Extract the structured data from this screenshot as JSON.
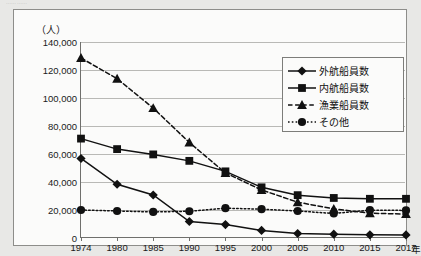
{
  "page": {
    "top_fragment": "⋯⋯  ⋯⋯",
    "unit_label": "（人）",
    "xaxis_unit": "年"
  },
  "chart_data": {
    "type": "line",
    "title": "",
    "subtitle": "",
    "xlabel": "年",
    "ylabel": "（人）",
    "ylim": [
      0,
      140000
    ],
    "ytick_step": 20000,
    "grid": true,
    "legend_position": "inside-top-right",
    "categories": [
      "1974",
      "1980",
      "1985",
      "1990",
      "1995",
      "2000",
      "2005",
      "2010",
      "2015",
      "2017"
    ],
    "ytick_labels": [
      "0",
      "20,000",
      "40,000",
      "60,000",
      "80,000",
      "100,000",
      "120,000",
      "140,000"
    ],
    "ytick_values": [
      0,
      20000,
      40000,
      60000,
      80000,
      100000,
      120000,
      140000
    ],
    "series": [
      {
        "name": "外航船員数",
        "marker": "diamond",
        "line": "solid",
        "color": "#111111",
        "values": [
          56800,
          38400,
          30700,
          11800,
          9600,
          5400,
          3200,
          2700,
          2300,
          2200
        ]
      },
      {
        "name": "内航船員数",
        "marker": "square",
        "line": "solid",
        "color": "#111111",
        "values": [
          71000,
          63500,
          59700,
          55100,
          47600,
          36200,
          30600,
          28600,
          28000,
          28000
        ]
      },
      {
        "name": "漁業船員数",
        "marker": "triangle",
        "line": "dashed",
        "color": "#111111",
        "values": [
          128600,
          113800,
          92800,
          68200,
          46500,
          34300,
          25600,
          20800,
          17700,
          17100
        ]
      },
      {
        "name": "その他",
        "marker": "circle",
        "line": "dotted",
        "color": "#111111",
        "values": [
          20000,
          19300,
          18600,
          19100,
          21300,
          20600,
          19300,
          17500,
          19900,
          19700
        ]
      }
    ]
  }
}
